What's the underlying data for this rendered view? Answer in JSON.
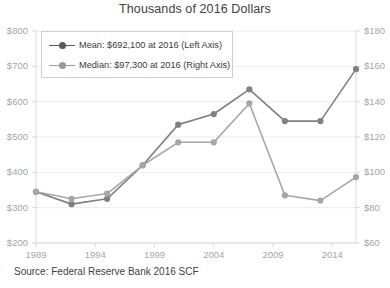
{
  "chart_data": {
    "type": "line",
    "title": "Thousands of 2016 Dollars",
    "xlabel": "",
    "ylabel": "",
    "grid": true,
    "legend_position": "top-left",
    "x": [
      1989,
      1992,
      1995,
      1998,
      2001,
      2004,
      2007,
      2010,
      2013,
      2016
    ],
    "xlim": [
      1989,
      2016
    ],
    "xticks": [
      "1989",
      "1994",
      "1999",
      "2004",
      "2009",
      "2014"
    ],
    "xtick_values": [
      1989,
      1994,
      1999,
      2004,
      2009,
      2014
    ],
    "left_axis": {
      "ylim": [
        200,
        800
      ],
      "yticks": [
        "$200",
        "$300",
        "$400",
        "$500",
        "$600",
        "$700",
        "$800"
      ],
      "ytick_values": [
        200,
        300,
        400,
        500,
        600,
        700,
        800
      ]
    },
    "right_axis": {
      "ylim": [
        60,
        180
      ],
      "yticks": [
        "$60",
        "$80",
        "$100",
        "$120",
        "$140",
        "$160",
        "$180"
      ],
      "ytick_values": [
        60,
        80,
        100,
        120,
        140,
        160,
        180
      ]
    },
    "series": [
      {
        "name": "Mean: $692,100 at 2016 (Left Axis)",
        "axis": "left",
        "color": "#808080",
        "values": [
          345,
          310,
          325,
          420,
          535,
          565,
          635,
          545,
          545,
          692
        ]
      },
      {
        "name": "Median: $97,300 at 2016 (Right Axis)",
        "axis": "right",
        "color": "#a6a6a6",
        "values": [
          89,
          85,
          88,
          104,
          117,
          117,
          139,
          87,
          84,
          97.3
        ]
      }
    ]
  },
  "title": "Thousands of 2016 Dollars",
  "legend": {
    "items": [
      {
        "label": "Mean: $692,100 at 2016 (Left Axis)"
      },
      {
        "label": "Median: $97,300 at 2016 (Right Axis)"
      }
    ]
  },
  "source": {
    "text": "Source: Federal Reserve Bank 2016 SCF"
  }
}
